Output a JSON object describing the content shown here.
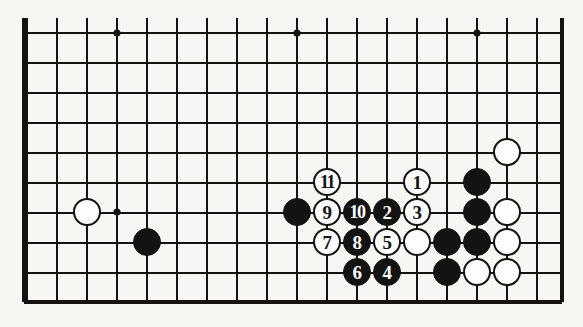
{
  "figure": {
    "kind": "go-board-diagram",
    "title": "",
    "caption": "",
    "background_color": "#f7f6f3",
    "line_color": "#131313",
    "black_color": "#131313",
    "white_color": "#fdfdfd"
  },
  "board": {
    "origin_x": 27,
    "origin_y": 33,
    "spacing": 30,
    "cols": 18,
    "rows": 9,
    "stone_radius": 14,
    "border_left_x": 24,
    "border_right_x": 562,
    "border_bottom_y": 302,
    "top_open": true,
    "star_points": [
      {
        "x": 117,
        "y": 33
      },
      {
        "x": 297,
        "y": 33
      },
      {
        "x": 477,
        "y": 33
      },
      {
        "x": 117,
        "y": 212
      }
    ]
  },
  "stones": [
    {
      "color": "white",
      "x": 87,
      "y": 212,
      "label": ""
    },
    {
      "color": "black",
      "x": 147,
      "y": 242,
      "label": ""
    },
    {
      "color": "black",
      "x": 297,
      "y": 212,
      "label": ""
    },
    {
      "color": "white",
      "x": 507,
      "y": 152,
      "label": ""
    },
    {
      "color": "black",
      "x": 477,
      "y": 182,
      "label": ""
    },
    {
      "color": "black",
      "x": 477,
      "y": 212,
      "label": ""
    },
    {
      "color": "white",
      "x": 507,
      "y": 212,
      "label": ""
    },
    {
      "color": "white",
      "x": 417,
      "y": 242,
      "label": ""
    },
    {
      "color": "black",
      "x": 447,
      "y": 242,
      "label": ""
    },
    {
      "color": "black",
      "x": 477,
      "y": 242,
      "label": ""
    },
    {
      "color": "white",
      "x": 507,
      "y": 242,
      "label": ""
    },
    {
      "color": "black",
      "x": 447,
      "y": 272,
      "label": ""
    },
    {
      "color": "white",
      "x": 477,
      "y": 272,
      "label": ""
    },
    {
      "color": "white",
      "x": 507,
      "y": 272,
      "label": ""
    },
    {
      "color": "white",
      "x": 327,
      "y": 182,
      "label": "11"
    },
    {
      "color": "white",
      "x": 417,
      "y": 182,
      "label": "1"
    },
    {
      "color": "white",
      "x": 327,
      "y": 212,
      "label": "9"
    },
    {
      "color": "black",
      "x": 357,
      "y": 212,
      "label": "10"
    },
    {
      "color": "black",
      "x": 387,
      "y": 212,
      "label": "2"
    },
    {
      "color": "white",
      "x": 417,
      "y": 212,
      "label": "3"
    },
    {
      "color": "white",
      "x": 327,
      "y": 242,
      "label": "7"
    },
    {
      "color": "black",
      "x": 357,
      "y": 242,
      "label": "8"
    },
    {
      "color": "white",
      "x": 387,
      "y": 242,
      "label": "5"
    },
    {
      "color": "black",
      "x": 357,
      "y": 272,
      "label": "6"
    },
    {
      "color": "black",
      "x": 387,
      "y": 272,
      "label": "4"
    }
  ],
  "move_sequence": [
    "1",
    "2",
    "3",
    "4",
    "5",
    "6",
    "7",
    "8",
    "9",
    "10",
    "11"
  ]
}
